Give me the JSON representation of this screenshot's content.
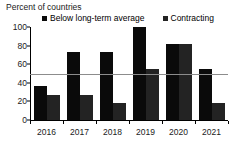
{
  "chart_data": {
    "type": "bar",
    "title": "Percent of countries",
    "xlabel": "",
    "ylabel": "",
    "categories": [
      "2016",
      "2017",
      "2018",
      "2019",
      "2020",
      "2021"
    ],
    "series": [
      {
        "name": "Below long-term average",
        "color": "#0a0a0a",
        "values": [
          37,
          73,
          73,
          100,
          82,
          55
        ]
      },
      {
        "name": "Contracting",
        "color": "#232323",
        "values": [
          27,
          27,
          18,
          55,
          82,
          18
        ]
      }
    ],
    "ylim": [
      0,
      100
    ],
    "yticks": [
      0,
      20,
      40,
      60,
      80,
      100
    ],
    "grid": false,
    "legend_position": "top",
    "reference_line": {
      "value": 50,
      "color": "#8c8c8c"
    }
  },
  "legend": {
    "items": [
      {
        "label": "Below long-term average",
        "marker": "square-marker-black"
      },
      {
        "label": "Contracting",
        "marker": "square-marker-dark"
      }
    ]
  }
}
